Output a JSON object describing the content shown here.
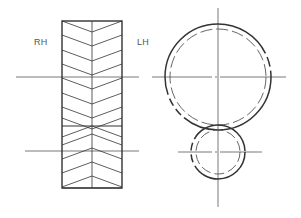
{
  "labels": {
    "rh": "RH",
    "lh": "LH"
  },
  "colors": {
    "stroke": "#333333",
    "thin": "#555555",
    "background": "#ffffff"
  },
  "gear_side_view": {
    "rect": {
      "x": 62,
      "y": 21,
      "w": 60,
      "h": 167
    },
    "center_x": 92,
    "split_y": 126,
    "upper_chevrons_edge_y": [
      21,
      35,
      50,
      64,
      78,
      93,
      107,
      118
    ],
    "lower_chevrons_center_y": [
      126,
      134,
      148,
      162,
      176,
      188
    ],
    "chevron_drop": 11,
    "centerlines_y": [
      77,
      151
    ]
  },
  "gear_end_view": {
    "large": {
      "cx": 218,
      "cy": 77,
      "r_outer": 53,
      "r_inner": 48
    },
    "small": {
      "cx": 218,
      "cy": 152,
      "r_outer": 27,
      "r_inner": 22
    }
  }
}
